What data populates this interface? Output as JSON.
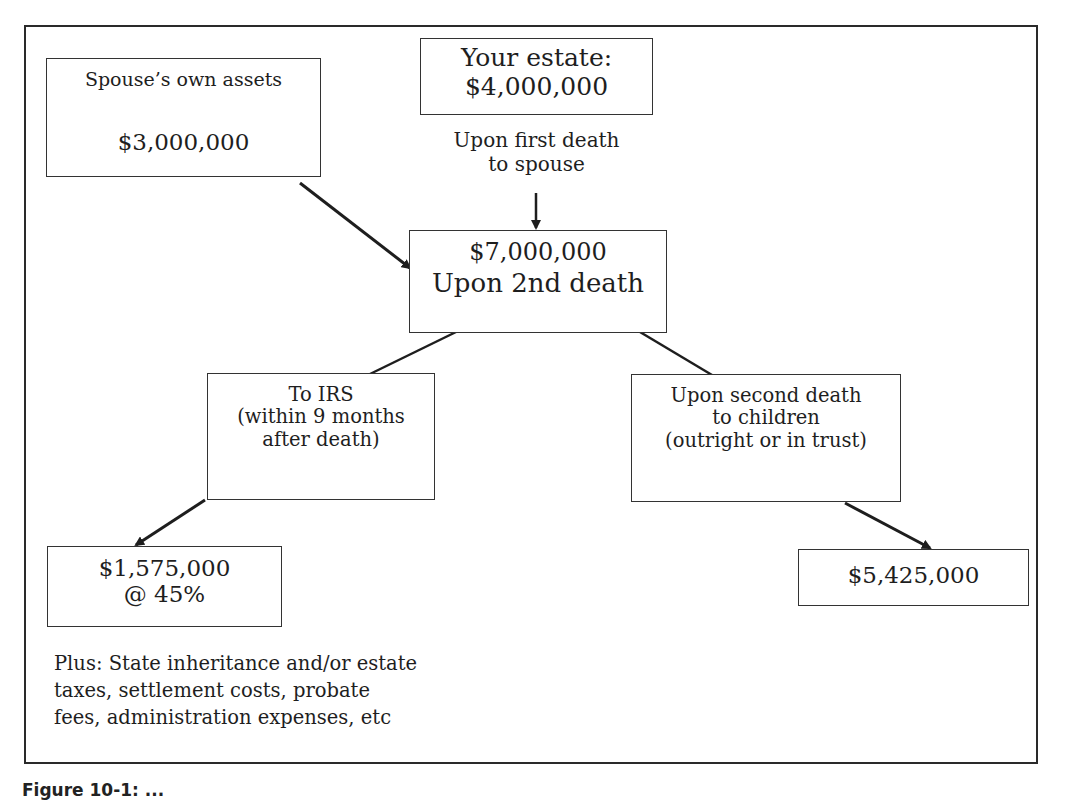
{
  "diagram": {
    "spouse_assets": {
      "label": "Spouse’s own assets",
      "value": "$3,000,000"
    },
    "your_estate": {
      "line1": "Your estate:",
      "line2": "$4,000,000"
    },
    "first_death_label": {
      "line1": "Upon first death",
      "line2": "to spouse"
    },
    "combined": {
      "line1": "$7,000,000",
      "line2": "Upon 2nd death"
    },
    "irs": {
      "line1": "To IRS",
      "line2": "(within 9 months",
      "line3": "after death)"
    },
    "children": {
      "line1": "Upon second death",
      "line2": "to children",
      "line3": "(outright or in trust)"
    },
    "tax_amount": {
      "line1": "$1,575,000",
      "line2": "@ 45%"
    },
    "children_amount": {
      "value": "$5,425,000"
    },
    "note": {
      "line1": "Plus: State inheritance and/or estate",
      "line2": "taxes, settlement costs, probate",
      "line3": "fees, administration expenses, etc"
    }
  },
  "caption": "Figure 10-1: ..."
}
